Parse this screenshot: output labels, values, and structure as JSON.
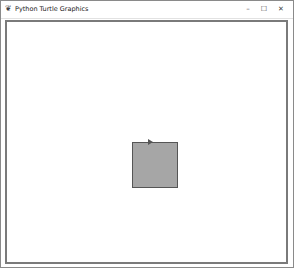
{
  "window": {
    "title": "Python Turtle Graphics",
    "app_icon": "feather-icon",
    "controls": {
      "minimize": "–",
      "maximize": "☐",
      "close": "✕"
    }
  },
  "canvas": {
    "background": "#ffffff",
    "border_color": "#7a7a7a",
    "shapes": [
      {
        "type": "square",
        "fill": "#a6a6a6",
        "outline": "#555555"
      }
    ],
    "turtle": {
      "shape": "arrow",
      "heading": "east",
      "color": "#555555"
    }
  },
  "caption": ""
}
